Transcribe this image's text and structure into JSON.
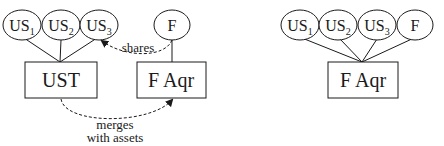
{
  "left_diagram": {
    "ellipses": [
      {
        "label": "US",
        "sub": "1"
      },
      {
        "label": "US",
        "sub": "2"
      },
      {
        "label": "US",
        "sub": "3"
      },
      {
        "label": "F",
        "sub": ""
      }
    ],
    "boxes": [
      {
        "label": "UST"
      },
      {
        "label": "F Aqr"
      }
    ],
    "edge_labels": {
      "shares": "shares",
      "merges_line1": "merges",
      "merges_line2": "with assets"
    }
  },
  "right_diagram": {
    "ellipses": [
      {
        "label": "US",
        "sub": "1"
      },
      {
        "label": "US",
        "sub": "2"
      },
      {
        "label": "US",
        "sub": "3"
      },
      {
        "label": "F",
        "sub": ""
      }
    ],
    "box": {
      "label": "F Aqr"
    }
  },
  "colors": {
    "stroke": "#1a1a1a",
    "background": "#ffffff"
  }
}
